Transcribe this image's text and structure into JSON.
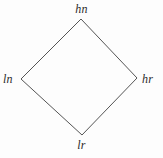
{
  "diagram": {
    "type": "hasse-diagram-square",
    "shape": "diamond",
    "background_color": "#fdfdfd",
    "edge_color": "#555555",
    "label_color": "#2b2b2b",
    "nodes": [
      {
        "id": "top",
        "label": "hn",
        "x": 81,
        "y": 19
      },
      {
        "id": "left",
        "label": "ln",
        "x": 21,
        "y": 79
      },
      {
        "id": "right",
        "label": "hr",
        "x": 137,
        "y": 78
      },
      {
        "id": "bottom",
        "label": "lr",
        "x": 82,
        "y": 135
      }
    ],
    "edges": [
      {
        "from": "left",
        "to": "top"
      },
      {
        "from": "top",
        "to": "right"
      },
      {
        "from": "right",
        "to": "bottom"
      },
      {
        "from": "bottom",
        "to": "left"
      }
    ]
  }
}
